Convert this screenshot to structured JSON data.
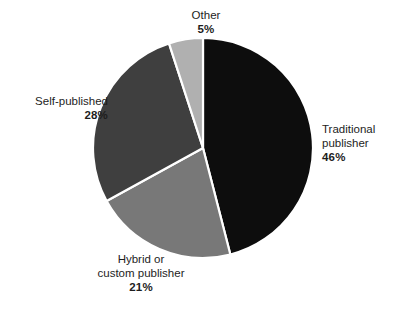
{
  "chart_data": {
    "type": "pie",
    "title": "",
    "subtitle": "",
    "xlabel": "",
    "ylabel": "",
    "grid": false,
    "legend_position": "none",
    "label_format": "name + percent",
    "start_angle_deg": 0,
    "direction": "clockwise",
    "categories": [
      "Traditional publisher",
      "Hybrid or custom publisher",
      "Self-published",
      "Other"
    ],
    "values": [
      46,
      21,
      28,
      5
    ],
    "value_labels": [
      "46%",
      "28%",
      "21%",
      "5%"
    ],
    "colors": [
      "#0d0d0d",
      "#787878",
      "#3f3f3f",
      "#b0b0b0"
    ],
    "slices": [
      {
        "name": "Traditional publisher",
        "value": 46,
        "value_label": "46%",
        "color": "#0d0d0d",
        "label_line1": "Traditional",
        "label_line2": "publisher"
      },
      {
        "name": "Hybrid or custom publisher",
        "value": 21,
        "value_label": "21%",
        "color": "#787878",
        "label_line1": "Hybrid or",
        "label_line2": "custom publisher"
      },
      {
        "name": "Self-published",
        "value": 28,
        "value_label": "28%",
        "color": "#3f3f3f",
        "label_line1": "Self-published",
        "label_line2": ""
      },
      {
        "name": "Other",
        "value": 5,
        "value_label": "5%",
        "color": "#b0b0b0",
        "label_line1": "Other",
        "label_line2": ""
      }
    ]
  },
  "style": {
    "background": "#ffffff",
    "separator_color": "#ffffff",
    "text_color": "#1d1d1d"
  }
}
